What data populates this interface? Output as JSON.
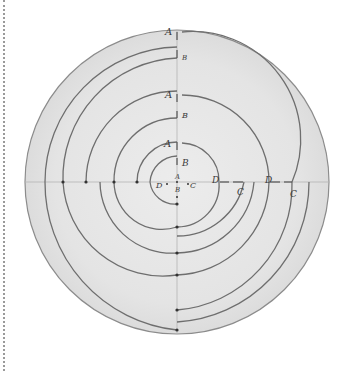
{
  "diagram": {
    "title": "",
    "colors": {
      "disc_fill": "#e6e6e6",
      "disc_edge": "#8c8c8c",
      "line": "#6e6e6e",
      "axis": "#b4b4b4",
      "dot": "#333333",
      "label": "#3a3a3a"
    },
    "outer_circle": {
      "cx": 177,
      "cy": 182,
      "r": 152
    },
    "labels": [
      {
        "id": "A1",
        "text": "A",
        "x": 165,
        "y": 35
      },
      {
        "id": "B1",
        "text": "B",
        "x": 182,
        "y": 60,
        "small": true
      },
      {
        "id": "A2",
        "text": "A",
        "x": 165,
        "y": 98
      },
      {
        "id": "B2",
        "text": "B",
        "x": 182,
        "y": 118
      },
      {
        "id": "A3",
        "text": "A",
        "x": 164,
        "y": 147
      },
      {
        "id": "B3",
        "text": "B",
        "x": 182,
        "y": 166
      },
      {
        "id": "A0",
        "text": "A",
        "x": 175,
        "y": 179,
        "small": true
      },
      {
        "id": "B0",
        "text": "B",
        "x": 175,
        "y": 192,
        "small": true
      },
      {
        "id": "D0",
        "text": "D",
        "x": 156,
        "y": 188,
        "small": true
      },
      {
        "id": "C0",
        "text": "C",
        "x": 190,
        "y": 188,
        "small": true
      },
      {
        "id": "D1",
        "text": "D",
        "x": 212,
        "y": 183
      },
      {
        "id": "C1",
        "text": "C",
        "x": 237,
        "y": 195
      },
      {
        "id": "D2",
        "text": "D",
        "x": 265,
        "y": 183
      },
      {
        "id": "C2",
        "text": "C",
        "x": 290,
        "y": 197
      }
    ],
    "dots_horizontal": [
      63,
      86,
      114,
      137
    ],
    "dots_vertical": [
      204,
      227,
      253,
      275,
      310,
      330
    ]
  }
}
